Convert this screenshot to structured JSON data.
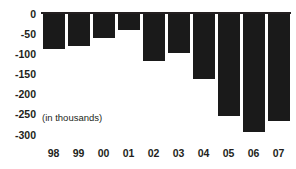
{
  "chart_data": {
    "type": "bar",
    "title": "",
    "subtitle": "",
    "xlabel": "",
    "ylabel": "",
    "annotation": "(in thousands)",
    "categories": [
      "98",
      "99",
      "00",
      "01",
      "02",
      "03",
      "04",
      "05",
      "06",
      "07"
    ],
    "values": [
      -89,
      -80,
      -60,
      -40,
      -117,
      -97,
      -161,
      -255,
      -293,
      -267
    ],
    "series": [
      {
        "name": "",
        "values": [
          -89,
          -80,
          -60,
          -40,
          -117,
          -97,
          -161,
          -255,
          -293,
          -267
        ]
      }
    ],
    "ylim": [
      -300,
      0
    ],
    "yticks": [
      0,
      -50,
      -100,
      -150,
      -200,
      -250,
      -300
    ],
    "ytick_labels": [
      "0",
      "-50",
      "-100",
      "-150",
      "-200",
      "-250",
      "-300"
    ],
    "grid": false,
    "legend": false,
    "legend_position": "none",
    "bar_color": "#1a1a1a",
    "axis_color": "#231f20",
    "background_color": "#ffffff"
  }
}
